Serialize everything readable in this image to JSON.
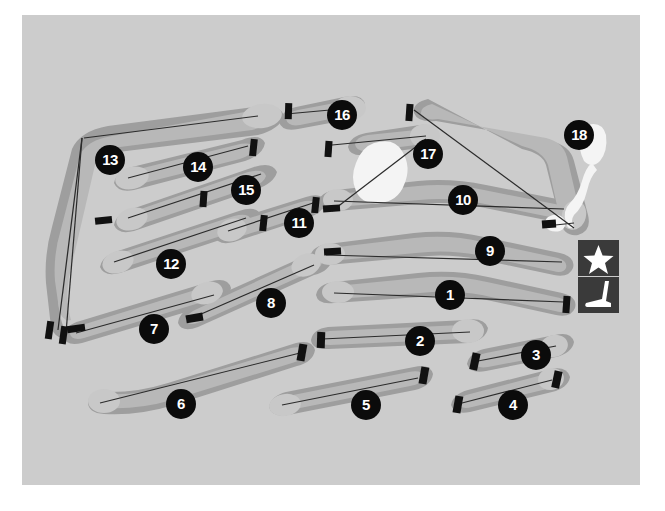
{
  "map": {
    "title": "Golf Course Layout Map",
    "kind": "golf-course-routing-plan",
    "background_color": "#cccccc",
    "rough_color": "#9e9e9e",
    "fairway_color": "#b5b5b5",
    "green_color": "#c4c4c4",
    "water_color": "#f2f2f2",
    "marker_color": "#0b0b0b",
    "marker_text_color": "#ffffff",
    "tee_color": "#111111",
    "centerline_color": "#2b2b2b",
    "border_color": "#ffffff"
  },
  "holes": [
    {
      "number": "1",
      "label_x": 428,
      "label_y": 280
    },
    {
      "number": "2",
      "label_x": 398,
      "label_y": 326
    },
    {
      "number": "3",
      "label_x": 514,
      "label_y": 340
    },
    {
      "number": "4",
      "label_x": 491,
      "label_y": 390
    },
    {
      "number": "5",
      "label_x": 344,
      "label_y": 390
    },
    {
      "number": "6",
      "label_x": 159,
      "label_y": 389
    },
    {
      "number": "7",
      "label_x": 132,
      "label_y": 314
    },
    {
      "number": "8",
      "label_x": 249,
      "label_y": 288
    },
    {
      "number": "9",
      "label_x": 468,
      "label_y": 236
    },
    {
      "number": "10",
      "label_x": 441,
      "label_y": 185
    },
    {
      "number": "11",
      "label_x": 277,
      "label_y": 208
    },
    {
      "number": "12",
      "label_x": 149,
      "label_y": 249
    },
    {
      "number": "13",
      "label_x": 88,
      "label_y": 145
    },
    {
      "number": "14",
      "label_x": 176,
      "label_y": 152
    },
    {
      "number": "15",
      "label_x": 224,
      "label_y": 175
    },
    {
      "number": "16",
      "label_x": 320,
      "label_y": 100
    },
    {
      "number": "17",
      "label_x": 406,
      "label_y": 139
    },
    {
      "number": "18",
      "label_x": 557,
      "label_y": 120
    }
  ],
  "legend": [
    {
      "key": "clubhouse",
      "icon": "star-icon",
      "description": "Clubhouse"
    },
    {
      "key": "practice",
      "icon": "golf-club-icon",
      "description": "Practice area / golf club"
    }
  ],
  "legend_positions": {
    "clubhouse": {
      "x": 578,
      "y": 240
    },
    "practice": {
      "x": 578,
      "y": 277
    }
  }
}
